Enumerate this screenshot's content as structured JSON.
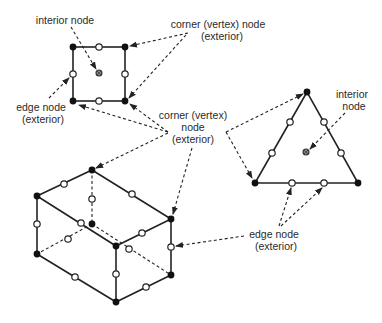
{
  "diagram": {
    "labels": {
      "square_interior": {
        "line1": "interior node"
      },
      "top_corner": {
        "line1": "corner (vertex) node",
        "line2": "(exterior)"
      },
      "left_edge": {
        "line1": "edge node",
        "line2": "(exterior)"
      },
      "middle_corner": {
        "line1": "corner (vertex)",
        "line2": "node",
        "line3": "(exterior)"
      },
      "triangle_interior": {
        "line1": "interior",
        "line2": "node"
      },
      "bottom_edge": {
        "line1": "edge node",
        "line2": "(exterior)"
      }
    },
    "node_types": {
      "corner": {
        "style": "filled black",
        "color": "#111111"
      },
      "edge": {
        "style": "hollow white",
        "color": "#ffffff"
      },
      "interior": {
        "style": "gray crossed",
        "color": "#888888"
      }
    },
    "elements": [
      {
        "name": "quadrilateral",
        "corner_nodes": 4,
        "edge_nodes": 4,
        "interior_nodes": 1
      },
      {
        "name": "triangle",
        "corner_nodes": 3,
        "edge_nodes": 6,
        "interior_nodes": 1
      },
      {
        "name": "hexahedron",
        "corner_nodes": 8,
        "edge_nodes": 12,
        "interior_nodes": 0
      }
    ]
  }
}
